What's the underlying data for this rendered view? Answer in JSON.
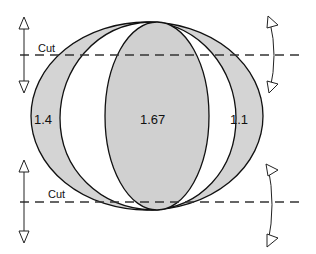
{
  "diagram": {
    "type": "lens-cut-diagram",
    "regions": [
      {
        "id": "left-crescent",
        "label": "1.4",
        "fill": "#d6d6d6"
      },
      {
        "id": "center-ellipse",
        "label": "1.67",
        "fill": "#d0d0d0"
      },
      {
        "id": "right-crescent",
        "label": "1.1",
        "fill": "#d6d6d6"
      }
    ],
    "cuts": [
      {
        "id": "top-cut",
        "label": "Cut"
      },
      {
        "id": "bottom-cut",
        "label": "Cut"
      }
    ],
    "colors": {
      "stroke": "#111111",
      "shade": "#d4d4d4",
      "background": "#ffffff"
    }
  },
  "labels": {
    "left": "1.4",
    "center": "1.67",
    "right": "1.1",
    "top_cut": "Cut",
    "bottom_cut": "Cut"
  }
}
